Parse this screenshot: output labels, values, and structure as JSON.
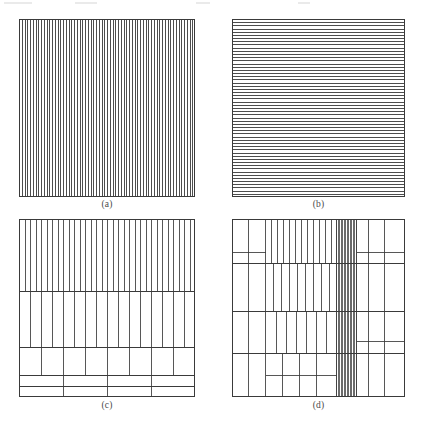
{
  "figure": {
    "background_color": "#ffffff",
    "line_color": "#3a3a3a",
    "border_color": "#3a3a3a",
    "caption_color": "#4a4a4a",
    "panels": [
      {
        "id": "a",
        "caption": "(a)",
        "x": 19,
        "y": 19,
        "width": 176,
        "height": 178
      },
      {
        "id": "b",
        "caption": "(b)",
        "x": 232,
        "y": 19,
        "width": 173,
        "height": 178
      },
      {
        "id": "c",
        "caption": "(c)",
        "x": 19,
        "y": 219,
        "width": 176,
        "height": 178
      },
      {
        "id": "d",
        "caption": "(d)",
        "x": 232,
        "y": 219,
        "width": 173,
        "height": 178
      }
    ]
  },
  "chart_data": {
    "type": "diagram",
    "title": "",
    "panels": [
      {
        "label": "(a)",
        "kind": "uniform-vertical-lines",
        "width": 176,
        "height": 178,
        "line_count": 64,
        "orientation": "vertical",
        "spacing_px": 2.75
      },
      {
        "label": "(b)",
        "kind": "uniform-horizontal-lines",
        "width": 173,
        "height": 178,
        "line_count": 56,
        "orientation": "horizontal",
        "spacing_px": 3.18
      },
      {
        "label": "(c)",
        "kind": "graded-horizontal-bands-with-vertical-splits",
        "width": 176,
        "height": 178,
        "bands": [
          {
            "y0": 0,
            "y1": 72,
            "vertical_divisions": 32
          },
          {
            "y0": 72,
            "y1": 128,
            "vertical_divisions": 16
          },
          {
            "y0": 128,
            "y1": 156,
            "vertical_divisions": 8
          },
          {
            "y0": 156,
            "y1": 167,
            "vertical_divisions": 4
          },
          {
            "y0": 167,
            "y1": 178,
            "vertical_divisions": 4
          }
        ]
      },
      {
        "label": "(d)",
        "kind": "adaptive-mesh-with-refined-band",
        "width": 173,
        "height": 178,
        "refined_band": {
          "x0": 104,
          "x1": 124,
          "column_count": 13
        },
        "rows": [
          {
            "y0": 0,
            "y1": 44
          },
          {
            "y0": 44,
            "y1": 92
          },
          {
            "y0": 92,
            "y1": 134
          },
          {
            "y0": 134,
            "y1": 178
          }
        ]
      }
    ]
  }
}
